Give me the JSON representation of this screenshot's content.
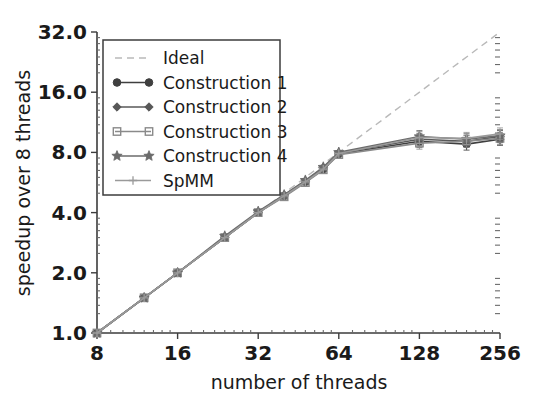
{
  "chart_data": {
    "type": "line",
    "title": "",
    "xlabel": "number of threads",
    "ylabel": "speedup over 8 threads",
    "xscale": "log2",
    "yscale": "log2",
    "xlim": [
      8,
      256
    ],
    "ylim": [
      1.0,
      32.0
    ],
    "xticks": [
      8,
      16,
      32,
      64,
      128,
      256
    ],
    "xticklabels": [
      "8",
      "16",
      "32",
      "64",
      "128",
      "256"
    ],
    "yticks": [
      1.0,
      2.0,
      4.0,
      8.0,
      16.0,
      32.0
    ],
    "yticklabels": [
      "1.0",
      "2.0",
      "4.0",
      "8.0",
      "16.0",
      "32.0"
    ],
    "grid": false,
    "legend_position": "upper left",
    "x": [
      8,
      12,
      16,
      24,
      32,
      40,
      48,
      56,
      64,
      128,
      192,
      256
    ],
    "series": [
      {
        "name": "Ideal",
        "marker": "none",
        "linestyle": "dashed",
        "color": "#b9b9b9",
        "x": [
          8,
          256
        ],
        "values": [
          1.0,
          32.0
        ]
      },
      {
        "name": "Construction 1",
        "marker": "circle",
        "linestyle": "solid",
        "color": "#3f3f3f",
        "values": [
          1.0,
          1.5,
          2.0,
          3.0,
          4.0,
          4.85,
          5.7,
          6.6,
          7.85,
          9.1,
          8.8,
          9.3
        ]
      },
      {
        "name": "Construction 2",
        "marker": "diamond",
        "linestyle": "solid",
        "color": "#585858",
        "values": [
          1.0,
          1.5,
          2.0,
          3.0,
          4.0,
          4.9,
          5.75,
          6.7,
          7.95,
          9.3,
          9.1,
          9.6
        ]
      },
      {
        "name": "Construction 3",
        "marker": "square",
        "linestyle": "solid",
        "color": "#8a8a8a",
        "values": [
          1.0,
          1.5,
          2.0,
          3.0,
          4.0,
          4.8,
          5.65,
          6.55,
          7.8,
          8.9,
          9.1,
          9.4
        ]
      },
      {
        "name": "Construction 4",
        "marker": "star",
        "linestyle": "solid",
        "color": "#6b6b6b",
        "values": [
          1.0,
          1.5,
          2.0,
          3.05,
          4.05,
          4.9,
          5.8,
          6.75,
          8.0,
          9.6,
          9.3,
          9.7
        ]
      },
      {
        "name": "SpMM",
        "marker": "plus",
        "linestyle": "solid",
        "color": "#9a9a9a",
        "values": [
          1.0,
          1.5,
          2.0,
          3.0,
          4.0,
          4.85,
          5.7,
          6.6,
          7.9,
          9.5,
          9.4,
          9.9
        ]
      }
    ],
    "errorbars": {
      "present": true,
      "at_x": [
        128,
        192,
        256
      ],
      "note": "small vertical caps at high thread counts"
    }
  },
  "legend": {
    "entries": [
      {
        "label": "Ideal"
      },
      {
        "label": "Construction 1"
      },
      {
        "label": "Construction 2"
      },
      {
        "label": "Construction 3"
      },
      {
        "label": "Construction 4"
      },
      {
        "label": "SpMM"
      }
    ]
  },
  "colors": {
    "background": "#ffffff",
    "axis": "#3c3c3c",
    "ideal": "#b9b9b9",
    "text": "#1a1a1a"
  }
}
